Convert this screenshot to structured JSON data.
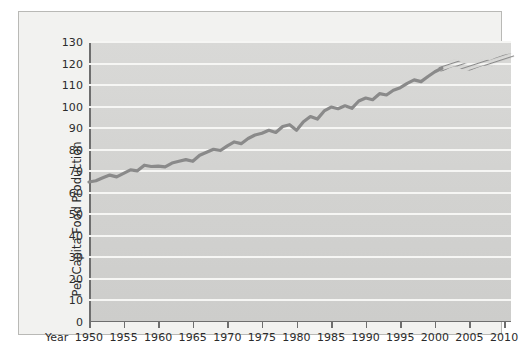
{
  "chart_data": {
    "type": "line",
    "title": "",
    "xlabel": "Year",
    "ylabel": "Per Capita Food Production",
    "xlim": [
      1950,
      2011
    ],
    "ylim": [
      0,
      130
    ],
    "grid": true,
    "grid_color": "#f6f6f4",
    "background_color": "#d4d4d2",
    "line_color": "#8a8a8a",
    "legend": "none",
    "x_ticks": [
      1950,
      1955,
      1960,
      1965,
      1970,
      1975,
      1980,
      1985,
      1990,
      1995,
      2000,
      2005,
      2010
    ],
    "x_tick_labels": [
      "1950",
      "1955",
      "1960",
      "1965",
      "1970",
      "1975",
      "1980",
      "1985",
      "1990",
      "1995",
      "2000",
      "2005",
      "2010"
    ],
    "y_ticks": [
      0,
      10,
      20,
      30,
      40,
      50,
      60,
      70,
      80,
      90,
      100,
      110,
      120,
      130
    ],
    "y_tick_labels": [
      "0",
      "10",
      "20",
      "30",
      "40",
      "50",
      "60",
      "70",
      "80",
      "90",
      "100",
      "110",
      "120",
      "130"
    ],
    "series": [
      {
        "name": "Per Capita Food Production (historical)",
        "style": "solid",
        "x": [
          1950,
          1951,
          1952,
          1953,
          1954,
          1955,
          1956,
          1957,
          1958,
          1959,
          1960,
          1961,
          1962,
          1963,
          1964,
          1965,
          1966,
          1967,
          1968,
          1969,
          1970,
          1971,
          1972,
          1973,
          1974,
          1975,
          1976,
          1977,
          1978,
          1979,
          1980,
          1981,
          1982,
          1983,
          1984,
          1985,
          1986,
          1987,
          1988,
          1989,
          1990,
          1991,
          1992,
          1993,
          1994,
          1995,
          1996,
          1997,
          1998,
          1999,
          2000,
          2001
        ],
        "values": [
          65.0,
          65.6,
          67.0,
          68.2,
          67.4,
          69.0,
          70.6,
          70.2,
          72.8,
          72.2,
          72.4,
          72.0,
          73.8,
          74.6,
          75.4,
          74.6,
          77.4,
          78.8,
          80.2,
          79.6,
          81.8,
          83.6,
          82.8,
          85.2,
          86.8,
          87.6,
          89.0,
          88.0,
          90.8,
          91.6,
          89.0,
          93.0,
          95.4,
          94.2,
          98.0,
          99.8,
          99.0,
          100.4,
          99.2,
          102.6,
          104.0,
          103.2,
          106.0,
          105.4,
          107.6,
          108.8,
          110.8,
          112.4,
          111.6,
          114.0,
          116.2,
          117.8
        ]
      },
      {
        "name": "Per Capita Food Production (projected)",
        "style": "dotted",
        "x": [
          2001,
          2002,
          2003,
          2004,
          2005,
          2006,
          2007,
          2008,
          2009,
          2010,
          2011
        ],
        "values": [
          117.8,
          119.4,
          120.4,
          118.8,
          118.2,
          119.4,
          120.6,
          120.0,
          121.4,
          122.6,
          123.2
        ]
      }
    ],
    "annotations": []
  }
}
